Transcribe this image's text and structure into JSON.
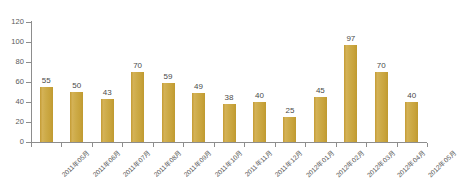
{
  "chart_data": {
    "type": "bar",
    "title": "",
    "subtitle": "",
    "xlabel": "",
    "ylabel": "",
    "ylim": [
      0,
      120
    ],
    "ytick_step": 20,
    "yticks": [
      120,
      100,
      80,
      60,
      40,
      20,
      0
    ],
    "grid": false,
    "legend": false,
    "bar_color": "#c9a63f",
    "axis_color": "#8d8d8d",
    "background": "#ffffff",
    "categories": [
      "2011年05月",
      "2011年06月",
      "2011年07月",
      "2011年08月",
      "2011年09月",
      "2011年10月",
      "2011年11月",
      "2011年12月",
      "2012年01月",
      "2012年02月",
      "2012年03月",
      "2012年04月",
      "2012年05月"
    ],
    "values": [
      55,
      50,
      43,
      70,
      59,
      49,
      38,
      40,
      25,
      45,
      97,
      70,
      40
    ],
    "data_labels": [
      "55",
      "50",
      "43",
      "70",
      "59",
      "49",
      "38",
      "40",
      "25",
      "45",
      "97",
      "70",
      "40"
    ]
  },
  "caption": {
    "text": ""
  }
}
